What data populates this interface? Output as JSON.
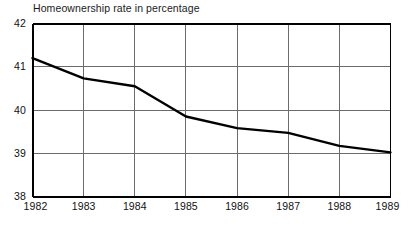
{
  "chart_data": {
    "type": "line",
    "title": "Homeownership rate in percentage",
    "xlabel": "",
    "ylabel": "",
    "x": [
      1982,
      1983,
      1984,
      1985,
      1986,
      1987,
      1988,
      1989
    ],
    "categories": [
      "1982",
      "1983",
      "1984",
      "1985",
      "1986",
      "1987",
      "1988",
      "1989"
    ],
    "series": [
      {
        "name": "Homeownership rate",
        "values": [
          41.2,
          40.73,
          40.55,
          39.85,
          39.58,
          39.47,
          39.17,
          39.02
        ]
      }
    ],
    "xlim": [
      1982,
      1989
    ],
    "ylim": [
      38,
      42
    ],
    "ytick_labels": [
      "38",
      "39",
      "40",
      "41",
      "42"
    ],
    "ytick_values": [
      38,
      39,
      40,
      41,
      42
    ],
    "xtick_labels": [
      "1982",
      "1983",
      "1984",
      "1985",
      "1986",
      "1987",
      "1988",
      "1989"
    ],
    "grid": true,
    "legend": "none",
    "line_color": "#000000",
    "grid_color": "#6b6b6b",
    "axis_color": "#000000",
    "background_color": "#ffffff"
  },
  "labels": {
    "y": [
      {
        "text": "42",
        "value": 42
      },
      {
        "text": "41",
        "value": 41
      },
      {
        "text": "40",
        "value": 40
      },
      {
        "text": "39",
        "value": 39
      },
      {
        "text": "38",
        "value": 38
      }
    ],
    "x": [
      {
        "text": "1982",
        "value": 1982
      },
      {
        "text": "1983",
        "value": 1983
      },
      {
        "text": "1984",
        "value": 1984
      },
      {
        "text": "1985",
        "value": 1985
      },
      {
        "text": "1986",
        "value": 1986
      },
      {
        "text": "1987",
        "value": 1987
      },
      {
        "text": "1988",
        "value": 1988
      },
      {
        "text": "1989",
        "value": 1989
      }
    ]
  }
}
